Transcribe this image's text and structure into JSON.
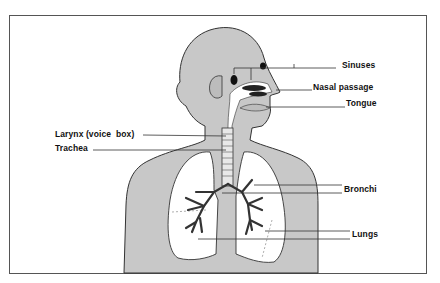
{
  "diagram": {
    "type": "anatomical labeled illustration",
    "colors": {
      "body_fill": "#c8c8c8",
      "outline": "#333333",
      "lung_fill": "#ffffff",
      "label_text": "#111111",
      "frame_border": "#555555"
    },
    "labels": {
      "sinuses": "Sinuses",
      "nasal_passage": "Nasal passage",
      "tongue": "Tongue",
      "larynx": "Larynx (voice  box)",
      "trachea": "Trachea",
      "bronchi": "Bronchi",
      "lungs": "Lungs"
    }
  }
}
